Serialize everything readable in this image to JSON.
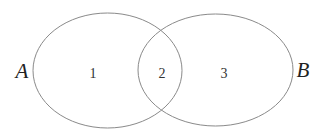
{
  "diagram": {
    "type": "venn",
    "stroke_color": "#8a8a8a",
    "sets": [
      {
        "id": "A",
        "label": "A",
        "ellipse": {
          "cx": 107.5,
          "cy": 70.5,
          "rx": 74.5,
          "ry": 57.5
        },
        "label_pos": {
          "x": 22,
          "y": 78
        }
      },
      {
        "id": "B",
        "label": "B",
        "ellipse": {
          "cx": 215.5,
          "cy": 70,
          "rx": 77.5,
          "ry": 56
        },
        "label_pos": {
          "x": 303,
          "y": 77
        }
      }
    ],
    "regions": [
      {
        "id": "1",
        "label": "1",
        "description": "A only",
        "pos": {
          "x": 93,
          "y": 78
        }
      },
      {
        "id": "2",
        "label": "2",
        "description": "A and B",
        "pos": {
          "x": 162,
          "y": 78
        }
      },
      {
        "id": "3",
        "label": "3",
        "description": "B only",
        "pos": {
          "x": 224,
          "y": 78
        }
      }
    ]
  }
}
